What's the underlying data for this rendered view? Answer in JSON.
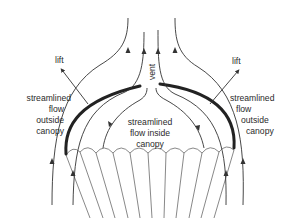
{
  "diagram": {
    "labels": {
      "vent": "vent",
      "lift_left": "lift",
      "lift_right": "lift",
      "outside_left": [
        "streamlined",
        "flow",
        "outside",
        "canopy"
      ],
      "outside_right": [
        "streamlined",
        "flow",
        "outside",
        "canopy"
      ],
      "inside": [
        "streamlined",
        "flow inside",
        "canopy"
      ]
    },
    "colors": {
      "background": "#ffffff",
      "stroke": "#333333",
      "text": "#2a2a2a"
    }
  }
}
